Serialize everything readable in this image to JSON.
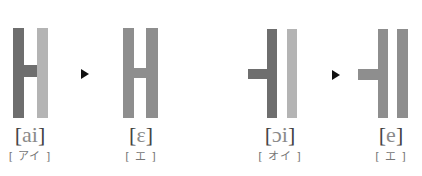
{
  "colors": {
    "dark": "#6e6e6e",
    "light": "#b4b4b4",
    "mid": "#8e8e8e",
    "arrow": "#111111"
  },
  "figures": [
    {
      "id": "ai",
      "ipa_open": "[",
      "ipa_symbol": "ai",
      "ipa_close": "]",
      "kana": "[ アイ ]",
      "shape": "H-split-shade"
    },
    {
      "id": "epsilon",
      "ipa_open": "[",
      "ipa_symbol": "ɛ",
      "ipa_close": "]",
      "kana": "[ エ ]",
      "shape": "H-uniform"
    },
    {
      "id": "oi",
      "ipa_open": "[",
      "ipa_symbol": "ɔi",
      "ipa_close": "]",
      "kana": "[ オイ ]",
      "shape": "stub-bar-bar-split-shade"
    },
    {
      "id": "e",
      "ipa_open": "[",
      "ipa_symbol": "e",
      "ipa_close": "]",
      "kana": "[ エ ]",
      "shape": "stub-bar-bar-uniform"
    }
  ],
  "arrows": [
    "right-triangle-arrow",
    "right-triangle-arrow"
  ]
}
